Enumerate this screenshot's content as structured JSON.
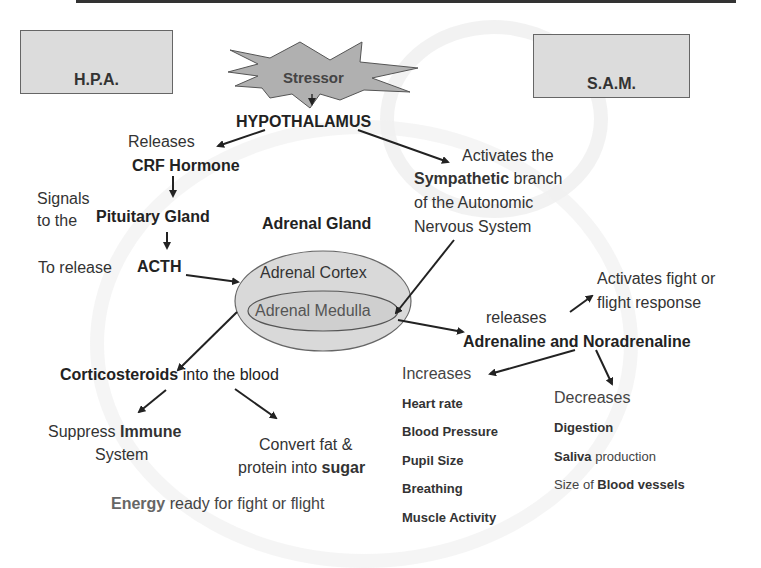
{
  "boxes": {
    "hpa": "H.P.A.",
    "sam": "S.A.M."
  },
  "stressor": "Stressor",
  "hypothalamus": "HYPOTHALAMUS",
  "hpa_path": {
    "releases": "Releases",
    "crf": "CRF Hormone",
    "signals_line1": "Signals",
    "signals_line2": "to the",
    "pituitary": "Pituitary Gland",
    "to_release": "To release",
    "acth": "ACTH",
    "corticosteroids": "Corticosteroids",
    "into_blood": " into the blood",
    "suppress": "Suppress ",
    "immune": "Immune",
    "system": "System",
    "convert_line1": "Convert fat &",
    "convert_line2": "protein into ",
    "sugar": "sugar",
    "energy": "Energy",
    "energy_rest": " ready for fight or flight"
  },
  "adrenal": {
    "gland_label": "Adrenal Gland",
    "cortex": "Adrenal Cortex",
    "medulla": "Adrenal Medulla"
  },
  "sam_path": {
    "activates_the": "Activates the",
    "sympathetic": "Sympathetic",
    "branch": " branch",
    "of_autonomic": "of the Autonomic",
    "nervous_system": "Nervous System",
    "activates_fight_line1": "Activates fight or",
    "activates_fight_line2": "flight response",
    "releases": "releases",
    "adrenaline": "Adrenaline and Noradrenaline",
    "increases": "Increases",
    "increases_items": [
      "Heart rate",
      "Blood Pressure",
      "Pupil Size",
      "Breathing",
      "Muscle Activity"
    ],
    "decreases": "Decreases",
    "decreases_items": [
      {
        "bold": "Digestion",
        "normal": ""
      },
      {
        "bold": "Saliva",
        "normal": " production"
      },
      {
        "pre": "Size of ",
        "bold": "Blood vessels"
      }
    ]
  }
}
